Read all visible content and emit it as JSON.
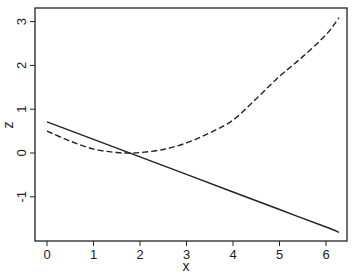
{
  "chart_data": {
    "type": "line",
    "title": "",
    "xlabel": "x",
    "ylabel": "z",
    "xlim": [
      -0.25,
      6.45
    ],
    "ylim": [
      -2.0,
      3.3
    ],
    "xticks": [
      0,
      1,
      2,
      3,
      4,
      5,
      6
    ],
    "yticks": [
      -1,
      0,
      1,
      2,
      3
    ],
    "grid": false,
    "legend": null,
    "series": [
      {
        "name": "solid",
        "style": "solid",
        "color": "#222222",
        "x": [
          0,
          1,
          2,
          3,
          4,
          5,
          6,
          6.28
        ],
        "y": [
          0.71,
          0.31,
          -0.09,
          -0.49,
          -0.89,
          -1.29,
          -1.69,
          -1.81
        ]
      },
      {
        "name": "dashed",
        "style": "dashed",
        "color": "#222222",
        "x": [
          0,
          0.5,
          1,
          1.5,
          1.8,
          2,
          2.5,
          3,
          3.5,
          4,
          4.5,
          5,
          5.5,
          6,
          6.28
        ],
        "y": [
          0.5,
          0.27,
          0.09,
          0.01,
          0.0,
          0.01,
          0.08,
          0.23,
          0.46,
          0.75,
          1.24,
          1.75,
          2.2,
          2.7,
          3.09
        ]
      }
    ]
  }
}
